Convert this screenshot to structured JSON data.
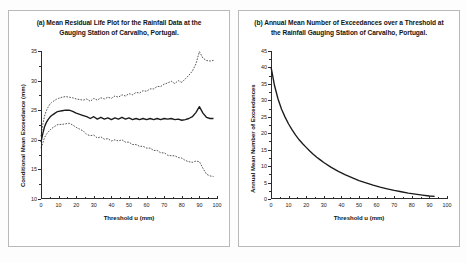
{
  "figure": {
    "background": "#ffffff",
    "line_color": "#1a1a1a",
    "panel_border": "#b9b9b9"
  },
  "panels": [
    {
      "id": "a",
      "title": "(a) Mean Residual Life Plot for the  Rainfall  Data at the Gauging Station of Carvalho, Portugal.",
      "title_line1": "(a) Mean Residual Life Plot for the  Rainfall  Data at the",
      "title_line2": "Gauging Station of Carvalho, Portugal.",
      "xlabel": "Threshold u (mm)",
      "ylabel": "Conditional Mean Exceedance (mm)",
      "xticks": [
        "0",
        "10",
        "20",
        "30",
        "40",
        "50",
        "60",
        "70",
        "80",
        "90",
        "100"
      ],
      "yticks": [
        "10",
        "15",
        "20",
        "25",
        "30",
        "35"
      ]
    },
    {
      "id": "b",
      "title": "(b) Annual Mean Number of Exceedances over a Threshold at the Rainfall Gauging Station of Carvalho, Portugal.",
      "title_line1": "(b) Annual Mean Number of Exceedances over a Threshold at",
      "title_line2": "the Rainfall Gauging Station of Carvalho, Portugal.",
      "xlabel": "Threshold u (mm)",
      "ylabel": "Annual Mean Number of Exceedances",
      "xticks": [
        "0",
        "10",
        "20",
        "30",
        "40",
        "50",
        "60",
        "70",
        "80",
        "90",
        "100"
      ],
      "yticks": [
        "0",
        "5",
        "10",
        "15",
        "20",
        "25",
        "30",
        "35",
        "40",
        "45"
      ]
    }
  ],
  "chart_data": [
    {
      "type": "line",
      "title": "(a) Mean Residual Life Plot for the  Rainfall  Data at the Gauging Station of Carvalho, Portugal.",
      "xlabel": "Threshold u (mm)",
      "ylabel": "Conditional Mean Exceedance (mm)",
      "xlim": [
        0,
        100
      ],
      "ylim": [
        10,
        35
      ],
      "grid": false,
      "legend": "none",
      "x": [
        0,
        1,
        2,
        3,
        4,
        5,
        6,
        7,
        8,
        9,
        10,
        12,
        14,
        16,
        18,
        20,
        22,
        24,
        26,
        28,
        30,
        32,
        34,
        36,
        38,
        40,
        42,
        44,
        46,
        48,
        50,
        52,
        54,
        56,
        58,
        60,
        62,
        64,
        66,
        68,
        70,
        72,
        74,
        76,
        78,
        80,
        82,
        84,
        86,
        88,
        90,
        92,
        94,
        96,
        98
      ],
      "series": [
        {
          "name": "Mean excess (estimate)",
          "style": "solid",
          "values": [
            19.6,
            21.0,
            22.2,
            22.9,
            23.4,
            23.8,
            24.1,
            24.3,
            24.5,
            24.7,
            24.8,
            24.9,
            25.0,
            25.0,
            24.8,
            24.5,
            24.3,
            24.1,
            23.9,
            23.6,
            23.9,
            23.5,
            23.8,
            23.5,
            23.7,
            23.4,
            23.7,
            23.5,
            23.8,
            23.5,
            23.7,
            23.4,
            23.6,
            23.4,
            23.6,
            23.4,
            23.6,
            23.4,
            23.6,
            23.4,
            23.6,
            23.5,
            23.6,
            23.4,
            23.5,
            23.3,
            23.4,
            23.6,
            23.9,
            24.6,
            25.6,
            24.5,
            23.8,
            23.6,
            23.6
          ]
        },
        {
          "name": "Upper 95% confidence limit",
          "style": "dashed",
          "values": [
            20.6,
            22.6,
            24.0,
            24.9,
            25.5,
            26.0,
            26.3,
            26.5,
            26.7,
            26.9,
            27.0,
            27.2,
            27.3,
            27.2,
            27.1,
            26.9,
            26.8,
            26.7,
            26.9,
            26.5,
            27.0,
            26.7,
            27.1,
            26.9,
            27.2,
            27.0,
            27.4,
            27.2,
            27.6,
            27.4,
            27.8,
            27.6,
            28.0,
            27.9,
            28.3,
            28.2,
            28.6,
            28.6,
            29.0,
            29.0,
            29.4,
            29.6,
            29.9,
            29.5,
            30.0,
            29.7,
            30.3,
            30.9,
            31.6,
            32.8,
            34.9,
            33.8,
            33.4,
            33.3,
            33.4
          ]
        },
        {
          "name": "Lower 95% confidence limit",
          "style": "dashed",
          "values": [
            18.6,
            19.4,
            20.4,
            20.9,
            21.3,
            21.6,
            21.9,
            22.1,
            22.3,
            22.5,
            22.6,
            22.6,
            22.7,
            22.8,
            22.5,
            22.1,
            21.8,
            21.5,
            20.9,
            20.7,
            20.8,
            20.3,
            20.5,
            20.1,
            20.2,
            19.8,
            20.0,
            19.8,
            20.0,
            19.6,
            19.6,
            19.2,
            19.2,
            18.9,
            18.9,
            18.6,
            18.6,
            18.2,
            18.2,
            17.8,
            17.8,
            17.4,
            17.3,
            17.3,
            17.0,
            16.9,
            16.5,
            16.3,
            16.2,
            16.4,
            16.3,
            15.2,
            14.2,
            13.9,
            13.8
          ]
        }
      ]
    },
    {
      "type": "line",
      "title": "(b) Annual Mean Number of Exceedances over a Threshold at the Rainfall Gauging Station of Carvalho, Portugal.",
      "xlabel": "Threshold u (mm)",
      "ylabel": "Annual Mean Number of Exceedances",
      "xlim": [
        0,
        100
      ],
      "ylim": [
        0,
        45
      ],
      "grid": false,
      "legend": "none",
      "x": [
        0,
        2,
        4,
        6,
        8,
        10,
        12,
        14,
        16,
        18,
        20,
        22,
        24,
        26,
        28,
        30,
        34,
        38,
        42,
        46,
        50,
        54,
        58,
        62,
        66,
        70,
        74,
        78,
        82,
        86,
        90,
        93
      ],
      "series": [
        {
          "name": "Annual mean number of exceedances",
          "style": "solid",
          "values": [
            40.2,
            34.5,
            30.4,
            27.3,
            24.9,
            22.8,
            21.0,
            19.4,
            18.0,
            16.8,
            15.7,
            14.6,
            13.6,
            12.7,
            11.9,
            11.1,
            9.7,
            8.5,
            7.4,
            6.5,
            5.6,
            4.9,
            4.2,
            3.6,
            3.1,
            2.6,
            2.2,
            1.8,
            1.5,
            1.2,
            0.9,
            0.8
          ]
        }
      ]
    }
  ]
}
